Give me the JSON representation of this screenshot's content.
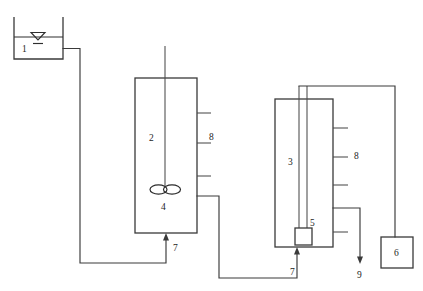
{
  "diagram": {
    "background_color": "#ffffff",
    "line_color": "#3a3a3a",
    "label_color": "#1d1d1d",
    "width": 423,
    "height": 291
  },
  "labels": {
    "feed_tank": "1",
    "stirred_reactor": "2",
    "column_reactor": "3",
    "impeller": "4",
    "distributor": "5",
    "collection_unit": "6",
    "inlet_stirred": "7",
    "inlet_column": "7",
    "sampling_ports_stirred": "8",
    "sampling_ports_column": "8",
    "effluent_outlet": "9"
  },
  "components": [
    {
      "id": "1",
      "name": "feed-tank",
      "label": "1",
      "description": "open feed tank with liquid level symbol"
    },
    {
      "id": "2",
      "name": "stirred-reactor",
      "label": "2",
      "description": "stirred tank reactor with vertical shaft"
    },
    {
      "id": "3",
      "name": "column-reactor",
      "label": "3",
      "description": "column reactor with internal riser tube"
    },
    {
      "id": "4",
      "name": "impeller",
      "label": "4",
      "description": "twin-blade impeller on shaft"
    },
    {
      "id": "5",
      "name": "distributor",
      "label": "5",
      "description": "bottom distributor box"
    },
    {
      "id": "6",
      "name": "collection-unit",
      "label": "6",
      "description": "collection vessel box"
    },
    {
      "id": "7",
      "name": "inlet-port",
      "label": "7",
      "description": "bottom feed inlet arrow"
    },
    {
      "id": "8",
      "name": "sampling-ports",
      "label": "8",
      "description": "side sampling ports"
    },
    {
      "id": "9",
      "name": "effluent-outlet",
      "label": "9",
      "description": "downward effluent discharge arrow"
    }
  ],
  "label_positions": {
    "tank1": {
      "x": 22,
      "y": 52
    },
    "reactor2": {
      "x": 149,
      "y": 141
    },
    "reactor3": {
      "x": 288,
      "y": 165
    },
    "impeller4": {
      "x": 161,
      "y": 210
    },
    "distributor5": {
      "x": 311,
      "y": 235
    },
    "collector6": {
      "x": 400,
      "y": 253
    },
    "inlet7a": {
      "x": 172,
      "y": 250
    },
    "inlet7b": {
      "x": 291,
      "y": 268
    },
    "ports8a": {
      "x": 209,
      "y": 138
    },
    "ports8b": {
      "x": 353,
      "y": 157
    },
    "outlet9": {
      "x": 362,
      "y": 271
    }
  }
}
